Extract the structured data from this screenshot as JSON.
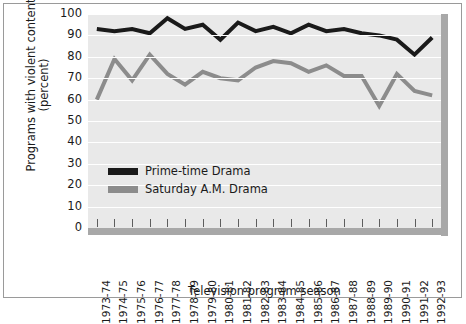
{
  "chart_data": {
    "type": "line",
    "title": "",
    "xlabel": "Television program season",
    "ylabel": "Programs with violent content (percent)",
    "ylim": [
      0,
      100
    ],
    "ytick_step": 10,
    "yticks": [
      0,
      10,
      20,
      30,
      40,
      50,
      60,
      70,
      80,
      90,
      100
    ],
    "grid": true,
    "grid_orientation": "horizontal",
    "legend_position": "inside-lower-left",
    "categories": [
      "1973-74",
      "1974-75",
      "1975-76",
      "1976-77",
      "1977-78",
      "1978-79",
      "1979-80",
      "1980-81",
      "1981-82",
      "1982-83",
      "1983-84",
      "1984-85",
      "1985-86",
      "1986-87",
      "1987-88",
      "1988-89",
      "1989-90",
      "1990-91",
      "1991-92",
      "1992-93"
    ],
    "series": [
      {
        "name": "Prime-time Drama",
        "color": "#1a1a1a",
        "values": [
          93,
          92,
          93,
          91,
          98,
          93,
          95,
          88,
          96,
          92,
          94,
          91,
          95,
          92,
          93,
          91,
          90,
          88,
          81,
          89
        ]
      },
      {
        "name": "Saturday A.M. Drama",
        "color": "#8c8c8c",
        "values": [
          60,
          79,
          69,
          81,
          72,
          67,
          73,
          70,
          69,
          75,
          78,
          77,
          73,
          76,
          71,
          71,
          57,
          72,
          64,
          62
        ]
      }
    ]
  },
  "legend": {
    "items": [
      {
        "label": "Prime-time Drama",
        "color": "#1a1a1a"
      },
      {
        "label": "Saturday A.M. Drama",
        "color": "#8c8c8c"
      }
    ]
  },
  "axes": {
    "y_title": "Programs with violent content (percent)",
    "x_title": "Television program season"
  },
  "style": {
    "plot_background": "#e9e9e9",
    "gridline_color": "#ffffff",
    "axis_bar_color": "#a8a8a8",
    "frame_color": "#9a9a9a",
    "text_color": "#1a1a1a"
  }
}
